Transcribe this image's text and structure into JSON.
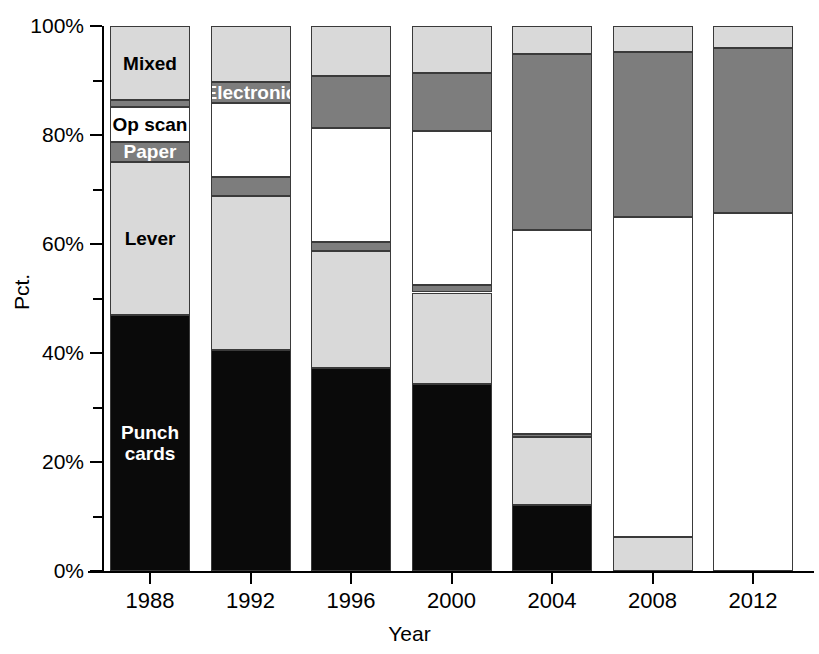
{
  "chart_data": {
    "type": "bar",
    "subtype": "stacked-bar-100-percent",
    "title": "",
    "xlabel": "Year",
    "ylabel": "Pct.",
    "categories": [
      "1988",
      "1992",
      "1996",
      "2000",
      "2004",
      "2008",
      "2012"
    ],
    "ylim": [
      0,
      100
    ],
    "ytick_labels": [
      "0%",
      "20%",
      "40%",
      "60%",
      "80%",
      "100%"
    ],
    "ytick_values": [
      0,
      20,
      40,
      60,
      80,
      100
    ],
    "yminor_tick_values": [
      10,
      30,
      50,
      70,
      90
    ],
    "grid": false,
    "legend": "inline-segment-labels",
    "stack_order_bottom_to_top": [
      "Punch cards",
      "Lever",
      "Paper",
      "Op scan",
      "Electronic",
      "Mixed"
    ],
    "colors": {
      "punch_cards": "#0a0a0a",
      "lever": "#d9d9d9",
      "paper": "#7d7d7d",
      "op_scan": "#ffffff",
      "electronic": "#7d7d7d",
      "mixed": "#d9d9d9",
      "axis": "#000000",
      "segment_border": "#3a3a3a",
      "background": "#ffffff"
    },
    "series": [
      {
        "name": "Punch cards",
        "values": [
          47.0,
          40.5,
          37.3,
          34.3,
          12.2,
          0.0,
          0.0
        ]
      },
      {
        "name": "Lever",
        "values": [
          28.1,
          28.3,
          21.4,
          16.8,
          12.4,
          6.2,
          0.0
        ]
      },
      {
        "name": "Paper",
        "values": [
          3.7,
          3.5,
          1.7,
          1.3,
          0.6,
          0.0,
          0.0
        ]
      },
      {
        "name": "Op scan",
        "values": [
          6.3,
          13.5,
          20.9,
          28.3,
          37.4,
          58.7,
          65.7
        ]
      },
      {
        "name": "Electronic",
        "values": [
          1.3,
          4.0,
          9.5,
          10.6,
          32.3,
          30.3,
          30.3
        ]
      },
      {
        "name": "Mixed",
        "values": [
          13.6,
          10.2,
          9.2,
          8.7,
          5.1,
          4.8,
          4.0
        ]
      }
    ],
    "segment_labels": [
      {
        "series": "Mixed",
        "category": "1988",
        "text": "Mixed",
        "text_color": "dark"
      },
      {
        "series": "Op scan",
        "category": "1988",
        "text": "Op scan",
        "text_color": "dark"
      },
      {
        "series": "Paper",
        "category": "1988",
        "text": "Paper",
        "text_color": "light"
      },
      {
        "series": "Lever",
        "category": "1988",
        "text": "Lever",
        "text_color": "dark"
      },
      {
        "series": "Punch cards",
        "category": "1988",
        "text": "Punch\ncards",
        "text_color": "light"
      },
      {
        "series": "Electronic",
        "category": "1992",
        "text": "Electronic",
        "text_color": "light"
      }
    ]
  },
  "axes": {
    "y_title": "Pct.",
    "x_title": "Year"
  }
}
